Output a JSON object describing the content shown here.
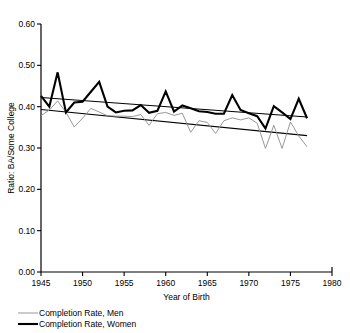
{
  "chart_data": {
    "type": "line",
    "title": "",
    "xlabel": "Year of Birth",
    "ylabel": "Ratio: BA/Some College",
    "xlim": [
      1945,
      1980
    ],
    "ylim": [
      0.0,
      0.6
    ],
    "xticks": [
      "1945",
      "1950",
      "1955",
      "1960",
      "1965",
      "1970",
      "1975",
      "1980"
    ],
    "xtick_values": [
      1945,
      1950,
      1955,
      1960,
      1965,
      1970,
      1975,
      1980
    ],
    "yticks": [
      "0.00",
      "0.10",
      "0.20",
      "0.30",
      "0.40",
      "0.50",
      "0.60"
    ],
    "ytick_values": [
      0.0,
      0.1,
      0.2,
      0.3,
      0.4,
      0.5,
      0.6
    ],
    "grid": false,
    "legend_position": "below-left",
    "x": [
      1945,
      1946,
      1947,
      1948,
      1949,
      1950,
      1951,
      1952,
      1953,
      1954,
      1955,
      1956,
      1957,
      1958,
      1959,
      1960,
      1961,
      1962,
      1963,
      1964,
      1965,
      1966,
      1967,
      1968,
      1969,
      1970,
      1971,
      1972,
      1973,
      1974,
      1975,
      1976,
      1977
    ],
    "series": [
      {
        "name": "Completion Rate, Men",
        "color": "#8c8c8c",
        "line_width": 0.9,
        "values": [
          0.378,
          0.392,
          0.414,
          0.386,
          0.351,
          0.372,
          0.396,
          0.387,
          0.378,
          0.377,
          0.377,
          0.376,
          0.381,
          0.355,
          0.383,
          0.386,
          0.379,
          0.384,
          0.338,
          0.366,
          0.362,
          0.335,
          0.366,
          0.373,
          0.368,
          0.373,
          0.36,
          0.299,
          0.355,
          0.299,
          0.363,
          0.329,
          0.303
        ]
      },
      {
        "name": "Completion Rate, Women",
        "color": "#000000",
        "line_width": 2.1,
        "values": [
          0.426,
          0.4,
          0.483,
          0.386,
          0.41,
          0.412,
          0.436,
          0.46,
          0.4,
          0.386,
          0.39,
          0.391,
          0.404,
          0.385,
          0.39,
          0.437,
          0.388,
          0.403,
          0.396,
          0.389,
          0.387,
          0.383,
          0.383,
          0.428,
          0.392,
          0.384,
          0.377,
          0.347,
          0.401,
          0.386,
          0.37,
          0.419,
          0.372
        ]
      }
    ],
    "trend_lines": [
      {
        "name": "Trend, Men",
        "color": "#000000",
        "line_width": 1.1,
        "x_start": 1945,
        "y_start": 0.393,
        "x_end": 1977,
        "y_end": 0.33
      },
      {
        "name": "Trend, Women",
        "color": "#000000",
        "line_width": 1.1,
        "x_start": 1945,
        "y_start": 0.422,
        "x_end": 1977,
        "y_end": 0.375
      }
    ]
  },
  "legend": {
    "items": [
      {
        "label": "Completion Rate, Men"
      },
      {
        "label": "Completion Rate, Women"
      }
    ]
  }
}
